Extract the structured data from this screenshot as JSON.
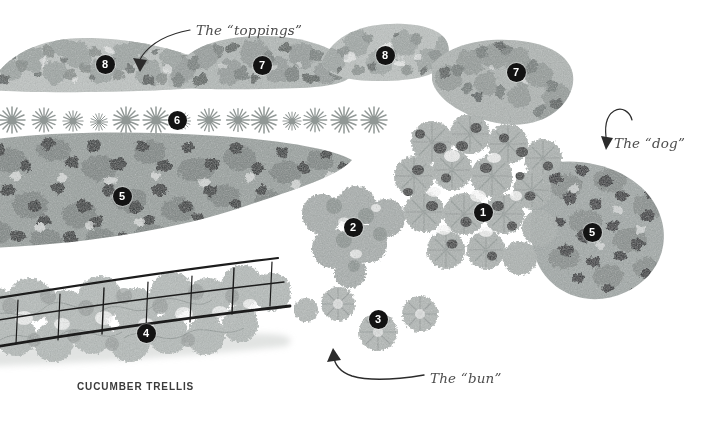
{
  "illustration": {
    "title": "Hot Dog Garden Bed Plan",
    "style": "watercolor garden plan illustration",
    "background_color": "#ffffff",
    "marker_color": "#131313",
    "marker_text_color": "#ffffff",
    "annotation_color": "#4d4d4d",
    "caption_color": "#3b3b3b"
  },
  "annotations": [
    {
      "label": "The “toppings”",
      "x": 196,
      "y": 22
    },
    {
      "label": "The “dog”",
      "x": 614,
      "y": 135
    },
    {
      "label": "The “bun”",
      "x": 430,
      "y": 370
    }
  ],
  "captions": [
    {
      "label": "CUCUMBER TRELLIS",
      "x": 77,
      "y": 381
    }
  ],
  "markers": [
    {
      "label": "8",
      "x": 105,
      "y": 64
    },
    {
      "label": "7",
      "x": 262,
      "y": 65
    },
    {
      "label": "8",
      "x": 385,
      "y": 55
    },
    {
      "label": "7",
      "x": 516,
      "y": 72
    },
    {
      "label": "6",
      "x": 177,
      "y": 120
    },
    {
      "label": "5",
      "x": 122,
      "y": 196
    },
    {
      "label": "2",
      "x": 353,
      "y": 227
    },
    {
      "label": "1",
      "x": 483,
      "y": 212
    },
    {
      "label": "5",
      "x": 592,
      "y": 232
    },
    {
      "label": "4",
      "x": 146,
      "y": 333
    },
    {
      "label": "3",
      "x": 378,
      "y": 319
    }
  ],
  "plant_beds": [
    {
      "name": "toppings-bed-left",
      "marker": "8"
    },
    {
      "name": "toppings-bed-center",
      "marker": "7"
    },
    {
      "name": "toppings-bed-right",
      "marker": "8"
    },
    {
      "name": "toppings-bed-far-right",
      "marker": "7"
    },
    {
      "name": "star-flower-row",
      "marker": "6"
    },
    {
      "name": "speckled-dog-bed-left",
      "marker": "5"
    },
    {
      "name": "speckled-dog-bed-right",
      "marker": "5"
    },
    {
      "name": "bun-cluster-left",
      "marker": "2"
    },
    {
      "name": "bun-cluster-center",
      "marker": "1"
    },
    {
      "name": "bun-cluster-bottom",
      "marker": "3"
    },
    {
      "name": "cucumber-trellis",
      "marker": "4"
    }
  ]
}
